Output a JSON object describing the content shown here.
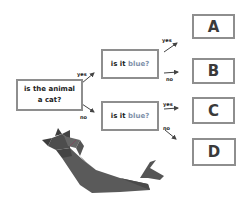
{
  "diagram": {
    "type": "decision-tree",
    "root": {
      "text_line1": "is the animal",
      "text_line2": "a cat?"
    },
    "branches": [
      {
        "edge_label": "yes",
        "question_prefix": "is it ",
        "question_highlight": "blue?"
      },
      {
        "edge_label": "no",
        "question_prefix": "is it ",
        "question_highlight": "blue?"
      }
    ],
    "leaf_edges": [
      {
        "label": "yes"
      },
      {
        "label": "no"
      },
      {
        "label": "yes"
      },
      {
        "label": "no"
      }
    ],
    "leaves": [
      {
        "label": "A"
      },
      {
        "label": "B"
      },
      {
        "label": "C"
      },
      {
        "label": "D"
      }
    ],
    "colors": {
      "border": "#8e8e8e",
      "highlight": "#7d90a9",
      "cat": "#555555"
    },
    "illustration": "origami-cat"
  }
}
